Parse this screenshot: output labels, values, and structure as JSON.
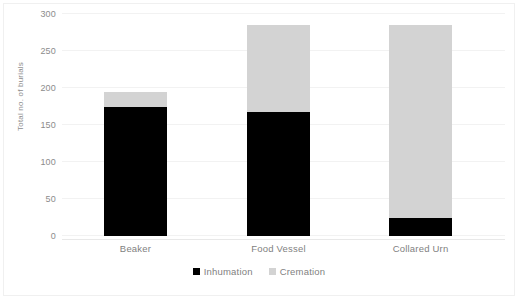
{
  "chart_data": {
    "type": "bar",
    "subtype": "stacked-vertical",
    "title": "",
    "xlabel": "",
    "ylabel": "Total no. of burials",
    "categories": [
      "Beaker",
      "Food Vessel",
      "Collared Urn"
    ],
    "series": [
      {
        "name": "Inhumation",
        "color": "#000000",
        "values": [
          175,
          168,
          25
        ]
      },
      {
        "name": "Cremation",
        "color": "#d3d3d3",
        "values": [
          20,
          117,
          260
        ]
      }
    ],
    "totals": [
      195,
      285,
      285
    ],
    "ylim": [
      0,
      300
    ],
    "y_ticks": [
      0,
      50,
      100,
      150,
      200,
      250,
      300
    ],
    "y_tick_labels": [
      "0",
      "50",
      "100",
      "150",
      "200",
      "250",
      "300"
    ],
    "grid": true,
    "grid_axis": "y",
    "legend_position": "bottom-center",
    "legend_entries": [
      "Inhumation",
      "Cremation"
    ]
  },
  "axes": {
    "y_title": "Total no. of burials",
    "tick_color": "#8c8c8c",
    "grid_color": "#f2f2f2"
  },
  "legend": {
    "items": [
      {
        "label": "Inhumation",
        "color": "#000000"
      },
      {
        "label": "Cremation",
        "color": "#d3d3d3"
      }
    ]
  }
}
